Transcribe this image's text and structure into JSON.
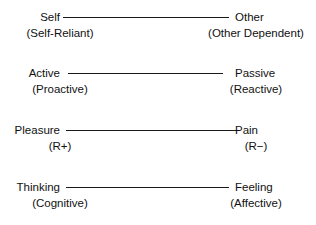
{
  "diagram": {
    "type": "bipolar-dimension-scales",
    "background_color": "#ffffff",
    "line_color": "#1a1a1a",
    "text_color": "#111111",
    "rows": [
      {
        "left_label": "Self",
        "left_sublabel": "(Self-Reliant)",
        "right_label": "Other",
        "right_sublabel": "(Other Dependent)",
        "top": 9,
        "line_left": 63,
        "line_width": 166
      },
      {
        "left_label": "Active",
        "left_sublabel": "(Proactive)",
        "right_label": "Passive",
        "right_sublabel": "(Reactive)",
        "top": 65,
        "line_left": 68,
        "line_width": 155
      },
      {
        "left_label": "Pleasure",
        "left_sublabel": "(R+)",
        "right_label": "Pain",
        "right_sublabel": "(R−)",
        "top": 122,
        "line_left": 66,
        "line_width": 172
      },
      {
        "left_label": "Thinking",
        "left_sublabel": "(Cognitive)",
        "right_label": "Feeling",
        "right_sublabel": "(Affective)",
        "top": 179,
        "line_left": 66,
        "line_width": 163
      }
    ]
  }
}
